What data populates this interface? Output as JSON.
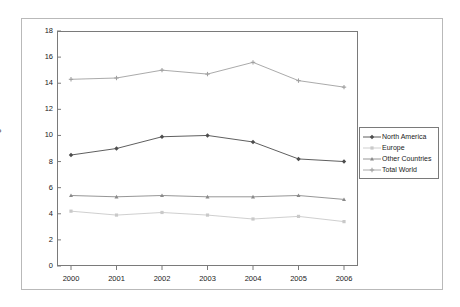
{
  "chart_data": {
    "type": "line",
    "title": "",
    "subtitle": "",
    "xlabel": "",
    "ylabel": "Nights",
    "categories": [
      "2000",
      "2001",
      "2002",
      "2003",
      "2004",
      "2005",
      "2006"
    ],
    "xlim": [
      2000,
      2006
    ],
    "ylim": [
      0,
      18
    ],
    "ytick_step": 2,
    "yticks": [
      "18",
      "16",
      "14",
      "12",
      "10",
      "8",
      "6",
      "4",
      "2",
      "0"
    ],
    "ytick_values": [
      18,
      16,
      14,
      12,
      10,
      8,
      6,
      4,
      2,
      0
    ],
    "grid": false,
    "legend_position": "right",
    "series": [
      {
        "name": "North America",
        "color": "#4d4d4d",
        "marker": "diamond",
        "values": [
          8.5,
          9.0,
          9.9,
          10.0,
          9.5,
          8.2,
          8.0
        ]
      },
      {
        "name": "Europe",
        "color": "#c9c9c9",
        "marker": "square",
        "values": [
          4.2,
          3.9,
          4.1,
          3.9,
          3.6,
          3.8,
          3.4
        ]
      },
      {
        "name": "Other Countries",
        "color": "#8a8a8a",
        "marker": "triangle",
        "values": [
          5.4,
          5.3,
          5.4,
          5.3,
          5.3,
          5.4,
          5.1
        ]
      },
      {
        "name": "Total World",
        "color": "#a0a0a0",
        "marker": "cross",
        "values": [
          14.3,
          14.4,
          15.0,
          14.7,
          15.6,
          14.2,
          13.7
        ]
      }
    ]
  },
  "colors": {
    "plot_border": "#7a7a7a",
    "figure_border": "#b9b9b9",
    "background": "#ffffff",
    "text": "#1a1a1a"
  }
}
